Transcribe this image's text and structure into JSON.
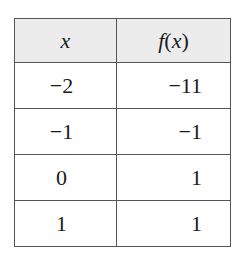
{
  "table": {
    "headers": {
      "x": "x",
      "fx_f": "f",
      "fx_open": "(",
      "fx_var": "x",
      "fx_close": ")"
    },
    "rows": [
      {
        "x": "−2",
        "fx": "−11"
      },
      {
        "x": "−1",
        "fx": "−1"
      },
      {
        "x": "0",
        "fx": "1"
      },
      {
        "x": "1",
        "fx": "1"
      }
    ]
  },
  "colors": {
    "header_bg": "#ececec",
    "border": "#555555",
    "text": "#1a1a1a"
  }
}
